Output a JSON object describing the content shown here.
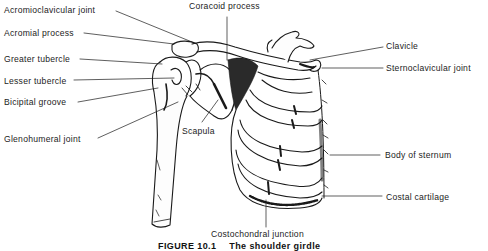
{
  "figure": {
    "caption": {
      "number": "FIGURE 10.1",
      "title": "The shoulder girdle"
    },
    "labels": {
      "acromioclavicular_joint": "Acromioclavicular joint",
      "acromial_process": "Acromial process",
      "greater_tubercle": "Greater tubercle",
      "lesser_tubercle": "Lesser tubercle",
      "bicipital_groove": "Bicipital groove",
      "glenohumeral_joint": "Glenohumeral joint",
      "coracoid_process": "Coracoid process",
      "scapula": "Scapula",
      "clavicle": "Clavicle",
      "sternoclavicular_joint": "Sternoclavicular joint",
      "body_of_sternum": "Body of sternum",
      "costal_cartilage": "Costal cartilage",
      "costochondral_junction": "Costochondral junction"
    },
    "colors": {
      "ink": "#1a1a1a",
      "background": "#ffffff"
    }
  }
}
